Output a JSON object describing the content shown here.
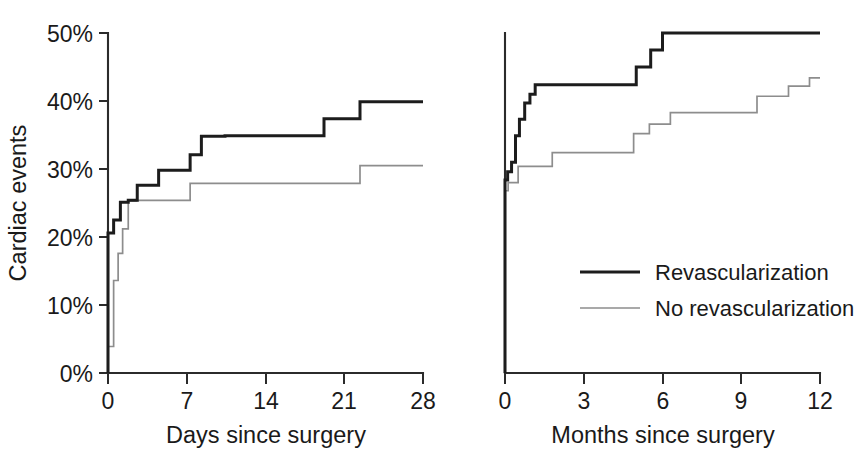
{
  "figure": {
    "background_color": "#ffffff",
    "primary_color": "#1c1c1c",
    "secondary_color": "#8d8d8d",
    "axis_color": "#2b2b2b"
  },
  "legend": {
    "position": "lower-center-right-panel",
    "entries": [
      {
        "label": "Revascularization",
        "color": "#1c1c1c",
        "style": "thick-solid"
      },
      {
        "label": "No revascularization",
        "color": "#8d8d8d",
        "style": "thin-solid"
      }
    ]
  },
  "shared": {
    "ylabel": "Cardiac events",
    "yticks": [
      "0%",
      "10%",
      "20%",
      "30%",
      "40%",
      "50%"
    ],
    "ytick_values": [
      0,
      10,
      20,
      30,
      40,
      50
    ],
    "ylim": [
      0,
      50
    ]
  },
  "chart_data": [
    {
      "type": "line",
      "subtype": "kaplan-meier-step",
      "panel": "left",
      "title": "",
      "xlabel": "Days since surgery",
      "ylabel": "Cardiac events",
      "xlim": [
        0,
        28
      ],
      "ylim": [
        0,
        50
      ],
      "xticks": [
        0,
        7,
        14,
        21,
        28
      ],
      "xtick_labels": [
        "0",
        "7",
        "14",
        "21",
        "28"
      ],
      "ytick_labels": [
        "0%",
        "10%",
        "20%",
        "30%",
        "40%",
        "50%"
      ],
      "grid": false,
      "series": [
        {
          "name": "Revascularization",
          "color": "#1c1c1c",
          "x": [
            0,
            0,
            0.5,
            0.5,
            1.1,
            1.1,
            1.8,
            1.8,
            2.6,
            2.6,
            4.5,
            4.5,
            7.3,
            7.3,
            8.3,
            8.3,
            10.4,
            10.4,
            19.2,
            19.2,
            22.4,
            22.4,
            28
          ],
          "y": [
            0,
            20.6,
            20.6,
            22.5,
            22.5,
            25.1,
            25.1,
            25.4,
            25.4,
            27.6,
            27.6,
            29.8,
            29.8,
            32.1,
            32.1,
            34.8,
            34.8,
            34.9,
            34.9,
            37.4,
            37.4,
            39.9,
            39.9
          ],
          "step": "post"
        },
        {
          "name": "No revascularization",
          "color": "#8d8d8d",
          "x": [
            0,
            0,
            0.5,
            0.5,
            0.9,
            0.9,
            1.3,
            1.3,
            1.8,
            1.8,
            2.5,
            2.5,
            7.3,
            7.3,
            22.4,
            22.4,
            28
          ],
          "y": [
            0,
            3.9,
            3.9,
            13.6,
            13.6,
            17.6,
            17.6,
            21.2,
            21.2,
            25.3,
            25.3,
            25.4,
            25.4,
            27.9,
            27.9,
            30.5,
            30.5
          ],
          "step": "post"
        }
      ]
    },
    {
      "type": "line",
      "subtype": "kaplan-meier-step",
      "panel": "right",
      "title": "",
      "xlabel": "Months since surgery",
      "ylabel": "Cardiac events",
      "xlim": [
        0,
        12
      ],
      "ylim": [
        0,
        50
      ],
      "xticks": [
        0,
        3,
        6,
        9,
        12
      ],
      "xtick_labels": [
        "0",
        "3",
        "6",
        "9",
        "12"
      ],
      "ytick_labels": [
        "0%",
        "10%",
        "20%",
        "30%",
        "40%",
        "50%"
      ],
      "grid": false,
      "series": [
        {
          "name": "Revascularization",
          "color": "#1c1c1c",
          "x": [
            0,
            0,
            0.1,
            0.1,
            0.25,
            0.25,
            0.4,
            0.4,
            0.55,
            0.55,
            0.75,
            0.75,
            0.95,
            0.95,
            1.15,
            1.15,
            5.0,
            5.0,
            5.55,
            5.55,
            6.0,
            6.0,
            12
          ],
          "y": [
            0,
            28.4,
            28.4,
            29.6,
            29.6,
            31.0,
            31.0,
            34.9,
            34.9,
            37.3,
            37.3,
            39.7,
            39.7,
            41.0,
            41.0,
            42.4,
            42.4,
            45.0,
            45.0,
            47.5,
            47.5,
            50.0,
            50.0
          ],
          "step": "post"
        },
        {
          "name": "No revascularization",
          "color": "#8d8d8d",
          "x": [
            0,
            0,
            0.12,
            0.12,
            0.5,
            0.5,
            1.8,
            1.8,
            4.9,
            4.9,
            5.5,
            5.5,
            6.3,
            6.3,
            9.6,
            9.6,
            10.8,
            10.8,
            11.6,
            11.6,
            12
          ],
          "y": [
            0,
            26.8,
            26.8,
            28.0,
            28.0,
            30.4,
            30.4,
            32.4,
            32.4,
            35.2,
            35.2,
            36.6,
            36.6,
            38.3,
            38.3,
            40.7,
            40.7,
            42.2,
            42.2,
            43.4,
            43.4,
            46.0
          ],
          "step": "post"
        }
      ]
    }
  ]
}
